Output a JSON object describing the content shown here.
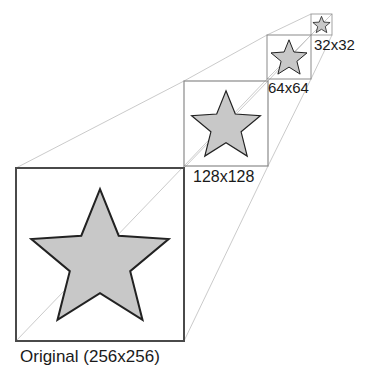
{
  "diagram": {
    "type": "image-pyramid",
    "colors": {
      "background": "#ffffff",
      "box_stroke": "#4a4a4a",
      "small_box_stroke": "#8a8a8a",
      "star_fill": "#c8c8c8",
      "star_stroke": "#222222",
      "connector": "#c4c4c4",
      "label": "#1a1a1a"
    },
    "levels": [
      {
        "id": "original",
        "label": "Original (256x256)",
        "box": [
          16,
          168,
          184,
          341
        ],
        "label_pos": [
          20,
          348
        ],
        "font_size": 17,
        "stroke_width": 2
      },
      {
        "id": "128",
        "label": "128x128",
        "box": [
          184,
          81,
          268,
          166
        ],
        "label_pos": [
          193,
          169
        ],
        "font_size": 16,
        "stroke_width": 1.2
      },
      {
        "id": "64",
        "label": "64x64",
        "box": [
          267,
          35,
          311,
          79
        ],
        "label_pos": [
          268,
          80
        ],
        "font_size": 15,
        "stroke_width": 1
      },
      {
        "id": "32",
        "label": "32x32",
        "box": [
          311,
          14,
          332,
          35
        ],
        "label_pos": [
          314,
          37
        ],
        "font_size": 15,
        "stroke_width": 0.8
      }
    ]
  }
}
